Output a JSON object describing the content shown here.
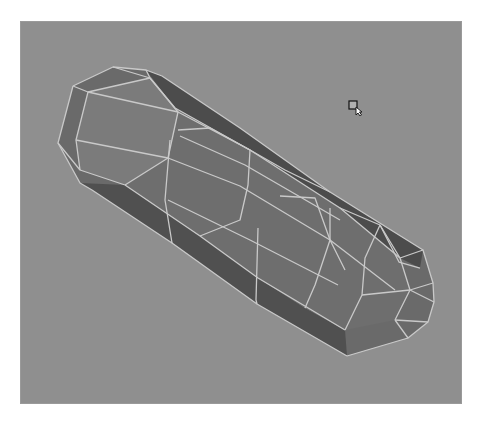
{
  "viewport": {
    "background": "#8f8f8f",
    "origin": [
      20,
      21
    ],
    "size": [
      442,
      383
    ]
  },
  "mesh": {
    "name": "capsule-polygon-mesh",
    "colors": {
      "dark_face": "#4c4c4c",
      "mid_face": "#6e6e6e",
      "light_face": "#7b7b7b",
      "cap_face": "#767676",
      "edge": "#c9c9c9",
      "edge_bright": "#e6e6e6"
    },
    "silhouette": "73,86 113,67 146,70 162,76 240,128 330,192 423,250 433,283 434,302 428,322 408,338 347,356 257,304 172,243 92,190 80,183 58,143",
    "dark_side_top": "146,70 162,76 240,128 330,192 423,250 420,268 400,258 340,208 250,150 175,108",
    "dark_side_bottom": "80,183 92,190 172,243 257,304 347,356 345,330 305,308 258,278 200,236 125,185",
    "light_front": "88,92 150,78 178,112 168,158 125,185 80,170 76,140",
    "front_body": "125,185 168,158 178,112 250,150 340,208 400,258 410,290 395,320 345,330 305,308 258,278 200,236",
    "edges": [
      "73,86 113,67 146,70 162,76",
      "73,86 58,143 80,183 92,190",
      "58,143 80,170 125,185",
      "73,86 88,92 150,78 146,70",
      "88,92 76,140 80,170",
      "150,78 178,112 168,158 125,185",
      "88,92 178,112",
      "76,140 168,158",
      "113,67 150,78",
      "178,112 250,150 340,208 400,258",
      "168,158 240,186 330,240 395,290",
      "125,185 200,236 258,278 345,330",
      "150,78 175,108 250,150",
      "162,76 240,128 330,192 423,250",
      "92,190 172,243 257,304 347,356",
      "178,130 210,128 250,150 248,185 240,220 200,236",
      "170,140 165,200 172,243",
      "180,136 245,165 340,220",
      "168,200 250,240 338,285",
      "280,196 315,198 330,240 315,285 305,308",
      "258,228 256,300 257,304",
      "250,150 285,170 330,192",
      "330,208 330,240 345,270",
      "340,208 380,225 400,258 410,290 395,320",
      "380,225 365,258 362,295 345,330",
      "400,258 423,250 433,283 434,302 428,322 408,338 395,320",
      "410,290 433,283",
      "410,290 434,302",
      "395,320 428,322",
      "362,295 410,290",
      "347,356 408,338",
      "380,225 399,262 420,268"
    ]
  },
  "cursor": {
    "icon": "select-arrow-cursor",
    "position": [
      348,
      100
    ]
  }
}
